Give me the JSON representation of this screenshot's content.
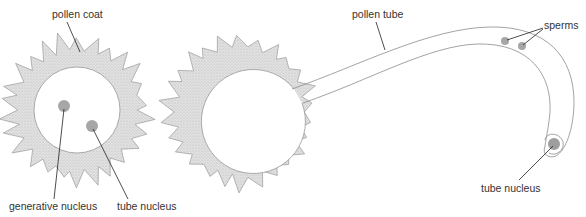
{
  "colors": {
    "coat_fill": "#d9d9d9",
    "coat_stroke": "#9a9a9a",
    "outline": "#8c8c8c",
    "nucleus": "#a6a6a6",
    "leader": "#222222",
    "text": "#333333"
  },
  "labels": {
    "pollen_coat": "pollen coat",
    "generative_nucleus": "generative nucleus",
    "tube_nucleus_grain": "tube nucleus",
    "pollen_tube": "pollen tube",
    "sperms": "sperms",
    "tube_nucleus_tip": "tube nucleus"
  },
  "structures": [
    {
      "name": "pollen grain (before germination)",
      "parts": [
        "pollen coat",
        "generative nucleus",
        "tube nucleus"
      ]
    },
    {
      "name": "germinated pollen grain",
      "parts": [
        "pollen tube",
        "sperms",
        "tube nucleus"
      ]
    }
  ]
}
